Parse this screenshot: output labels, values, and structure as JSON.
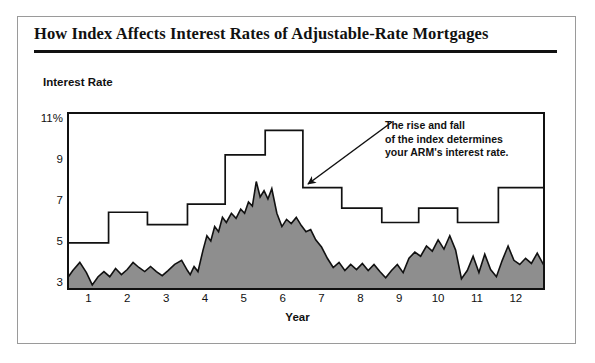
{
  "card": {
    "title": "How Index Affects Interest Rates of Adjustable-Rate Mortgages"
  },
  "annotation": {
    "line1": "The rise and fall",
    "line2": "of the index determines",
    "line3": "your ARM's interest rate."
  },
  "colors": {
    "index_fill": "#8e8e8e",
    "index_stroke": "#111111",
    "arm_stroke": "#111111",
    "frame": "#111111",
    "card_border": "#9a9a9a",
    "background": "#ffffff",
    "text": "#111111"
  },
  "chart_data": {
    "type": "area",
    "title": "How Index Affects Interest Rates of Adjustable-Rate Mortgages",
    "xlabel": "Year",
    "ylabel": "Interest Rate",
    "ylim": [
      2.6,
      11.3
    ],
    "xlim": [
      0.45,
      12.75
    ],
    "grid": false,
    "legend_position": "none",
    "ytick_labels": [
      "11%",
      "9",
      "7",
      "5",
      "3"
    ],
    "ytick_values": [
      11,
      9,
      7,
      5,
      3
    ],
    "xtick_labels": [
      "1",
      "2",
      "3",
      "4",
      "5",
      "6",
      "7",
      "8",
      "9",
      "10",
      "11",
      "12"
    ],
    "xtick_values": [
      1,
      2,
      3,
      4,
      5,
      6,
      7,
      8,
      9,
      10,
      11,
      12
    ],
    "series": [
      {
        "name": "ARM interest rate",
        "type": "step",
        "style": "line",
        "segments": [
          {
            "x_start": 0.45,
            "x_end": 1.52,
            "value": 4.9
          },
          {
            "x_start": 1.52,
            "x_end": 2.52,
            "value": 6.4
          },
          {
            "x_start": 2.52,
            "x_end": 3.55,
            "value": 5.8
          },
          {
            "x_start": 3.55,
            "x_end": 4.52,
            "value": 6.8
          },
          {
            "x_start": 4.52,
            "x_end": 5.55,
            "value": 9.2
          },
          {
            "x_start": 5.55,
            "x_end": 6.52,
            "value": 10.4
          },
          {
            "x_start": 6.52,
            "x_end": 7.52,
            "value": 7.6
          },
          {
            "x_start": 7.52,
            "x_end": 8.55,
            "value": 6.6
          },
          {
            "x_start": 8.55,
            "x_end": 9.5,
            "value": 5.9
          },
          {
            "x_start": 9.5,
            "x_end": 10.5,
            "value": 6.6
          },
          {
            "x_start": 10.5,
            "x_end": 11.55,
            "value": 5.9
          },
          {
            "x_start": 11.55,
            "x_end": 12.75,
            "value": 7.6
          }
        ]
      },
      {
        "name": "Index",
        "type": "area",
        "style": "filled-area",
        "baseline": 2.6,
        "x": [
          0.45,
          0.6,
          0.78,
          0.95,
          1.1,
          1.25,
          1.4,
          1.55,
          1.7,
          1.85,
          2.0,
          2.15,
          2.3,
          2.45,
          2.6,
          2.75,
          2.9,
          3.05,
          3.22,
          3.4,
          3.55,
          3.62,
          3.72,
          3.82,
          3.95,
          4.05,
          4.15,
          4.25,
          4.35,
          4.45,
          4.55,
          4.68,
          4.8,
          4.92,
          5.02,
          5.12,
          5.22,
          5.32,
          5.42,
          5.52,
          5.62,
          5.72,
          5.85,
          5.98,
          6.1,
          6.22,
          6.35,
          6.48,
          6.6,
          6.72,
          6.85,
          7.0,
          7.15,
          7.3,
          7.45,
          7.6,
          7.75,
          7.9,
          8.05,
          8.2,
          8.35,
          8.5,
          8.65,
          8.8,
          8.95,
          9.1,
          9.25,
          9.4,
          9.55,
          9.7,
          9.85,
          10.0,
          10.15,
          10.3,
          10.45,
          10.6,
          10.75,
          10.9,
          11.05,
          11.2,
          11.35,
          11.5,
          11.65,
          11.8,
          11.95,
          12.1,
          12.25,
          12.4,
          12.55,
          12.75
        ],
        "y": [
          3.15,
          3.55,
          3.95,
          3.45,
          2.85,
          3.25,
          3.5,
          3.25,
          3.65,
          3.35,
          3.6,
          3.95,
          3.7,
          3.5,
          3.75,
          3.5,
          3.3,
          3.55,
          3.85,
          4.05,
          3.55,
          3.35,
          3.75,
          3.5,
          4.55,
          5.25,
          5.0,
          5.7,
          5.45,
          6.15,
          5.9,
          6.35,
          6.1,
          6.55,
          6.35,
          6.9,
          6.7,
          7.9,
          7.15,
          7.45,
          7.05,
          7.55,
          6.35,
          5.7,
          6.05,
          5.85,
          6.15,
          5.75,
          5.45,
          5.55,
          5.05,
          4.7,
          4.15,
          3.7,
          3.95,
          3.55,
          3.85,
          3.6,
          3.9,
          3.55,
          3.85,
          3.5,
          3.2,
          3.55,
          3.85,
          3.45,
          4.15,
          4.45,
          4.25,
          4.75,
          4.5,
          5.05,
          4.6,
          5.25,
          4.55,
          3.15,
          3.55,
          4.25,
          3.45,
          4.35,
          3.6,
          3.25,
          4.05,
          4.75,
          4.05,
          3.85,
          4.15,
          3.9,
          4.4,
          3.7
        ]
      }
    ]
  }
}
